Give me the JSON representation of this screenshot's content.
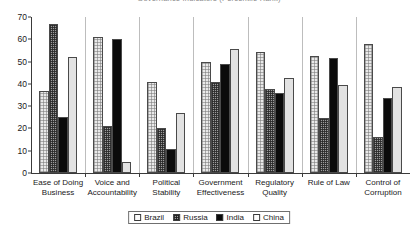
{
  "chart_data": {
    "type": "bar",
    "title": "Governance Indicators (Percentile Rank)",
    "xlabel": "",
    "ylabel": "",
    "ylim": [
      0,
      70
    ],
    "yticks": [
      0,
      10,
      20,
      30,
      40,
      50,
      60,
      70
    ],
    "grid": false,
    "legend_position": "bottom",
    "categories": [
      "Ease of Doing Business",
      "Voice and Accountability",
      "Political Stability",
      "Government Effectiveness",
      "Regulatory Quality",
      "Rule of Law",
      "Control of Corruption"
    ],
    "series": [
      {
        "name": "Brazil",
        "color": "#e9e9e9",
        "pattern": "fine-grid",
        "values": [
          37,
          61,
          41,
          50,
          54.5,
          52.7,
          57.8
        ]
      },
      {
        "name": "Russia",
        "color": "#9d9d9d",
        "pattern": "checker",
        "values": [
          67,
          21,
          20,
          40.7,
          37.5,
          24.8,
          16.2
        ]
      },
      {
        "name": "India",
        "color": "#0b0b0b",
        "pattern": "solid",
        "values": [
          25,
          60,
          11,
          49,
          35.7,
          51.8,
          33.7
        ]
      },
      {
        "name": "China",
        "color": "#e2e2e2",
        "pattern": "plain",
        "values": [
          52,
          5,
          27,
          55.8,
          42.7,
          39.7,
          38.7
        ]
      }
    ]
  },
  "x_labels": [
    {
      "line1": "Ease of Doing",
      "line2": "Business"
    },
    {
      "line1": "Voice and",
      "line2": "Accountability"
    },
    {
      "line1": "Political",
      "line2": "Stability"
    },
    {
      "line1": "Government",
      "line2": "Effectiveness"
    },
    {
      "line1": "Regulatory",
      "line2": "Quality"
    },
    {
      "line1": "Rule of Law",
      "line2": ""
    },
    {
      "line1": "Control of",
      "line2": "Corruption"
    }
  ],
  "legend": {
    "items": [
      {
        "label": "Brazil",
        "key": "brazil"
      },
      {
        "label": "Russia",
        "key": "russia"
      },
      {
        "label": "India",
        "key": "india"
      },
      {
        "label": "China",
        "key": "china"
      }
    ]
  }
}
